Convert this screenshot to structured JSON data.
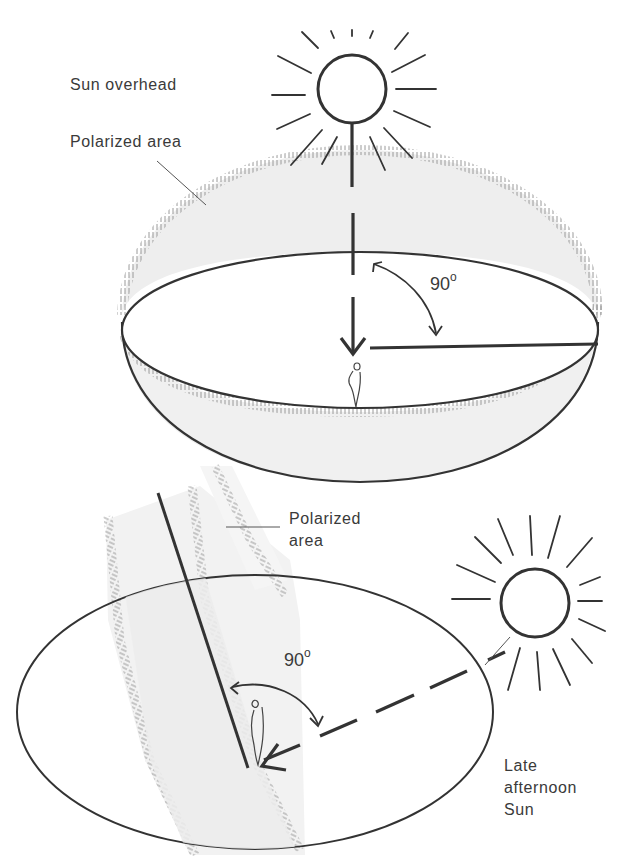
{
  "figure": {
    "top_panel": {
      "sun_label": "Sun overhead",
      "polarized_label": "Polarized area",
      "angle_value": "90",
      "angle_unit": "o"
    },
    "bottom_panel": {
      "polarized_label_line1": "Polarized",
      "polarized_label_line2": "area",
      "angle_value": "90",
      "angle_unit": "o",
      "sun_label_line1": "Late",
      "sun_label_line2": "afternoon",
      "sun_label_line3": "Sun"
    },
    "icons": [
      "sun-icon",
      "observer-figure-icon",
      "arrow-icon",
      "angle-arc-icon"
    ],
    "colors": {
      "ink": "#333333",
      "band_fill": "#ececec",
      "hatch": "#9a9a9a",
      "background": "#ffffff"
    }
  }
}
